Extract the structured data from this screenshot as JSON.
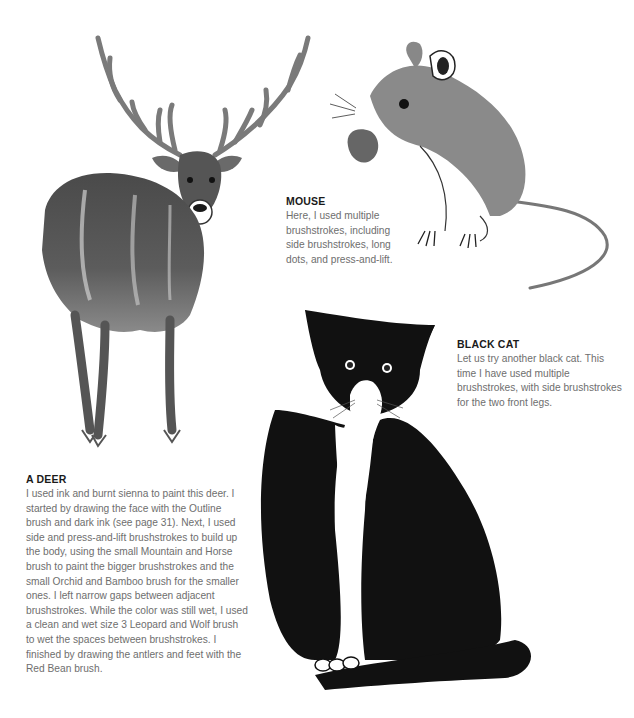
{
  "page": {
    "background": "#ffffff",
    "text_color": "#6e6e6e",
    "heading_color": "#1a1a1a"
  },
  "illustrations": {
    "deer": {
      "subject": "deer",
      "alt": "Ink and burnt sienna painting of a stag with large antlers"
    },
    "mouse": {
      "subject": "mouse",
      "alt": "Gray ink painting of a mouse holding a nut"
    },
    "cat": {
      "subject": "black cat",
      "alt": "Black and white ink painting of a seated black cat"
    }
  },
  "captions": {
    "mouse": {
      "title": "MOUSE",
      "body": "Here, I used multiple brushstrokes, including side brushstrokes, long dots, and press-and-lift."
    },
    "cat": {
      "title": "BLACK CAT",
      "body": "Let us try another black cat. This time I have used multiple brushstrokes, with side brushstrokes for the two front legs."
    },
    "deer": {
      "title": "A DEER",
      "body": "I used ink and burnt sienna to paint this deer. I started by drawing the face with the Outline brush and dark ink (see page 31). Next, I used side and press-and-lift brushstrokes to build up the body, using the small Mountain and Horse brush to paint the bigger brushstrokes and the small Orchid and Bamboo brush for the smaller ones. I left narrow gaps between adjacent brushstrokes. While the color was still wet, I used a clean and wet size 3 Leopard and Wolf brush to wet the spaces between brushstrokes. I finished by drawing the antlers and feet with the Red Bean brush."
    }
  }
}
